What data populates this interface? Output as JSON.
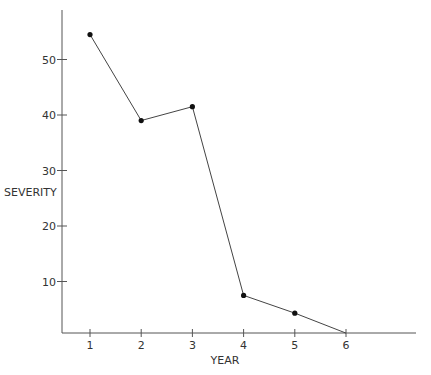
{
  "chart_data": {
    "type": "line",
    "title": "",
    "xlabel": "YEAR",
    "ylabel": "SEVERITY",
    "x": [
      1,
      2,
      3,
      4,
      5,
      6
    ],
    "categories": [
      "1",
      "2",
      "3",
      "4",
      "5",
      "6"
    ],
    "series": [
      {
        "name": "Severity",
        "values": [
          54.5,
          39,
          41.5,
          7.5,
          4.3,
          0.7
        ],
        "markers": [
          true,
          true,
          true,
          true,
          true,
          false
        ]
      }
    ],
    "xticks": [
      "1",
      "2",
      "3",
      "4",
      "5",
      "6"
    ],
    "yticks": [
      "10",
      "20",
      "30",
      "40",
      "50"
    ],
    "ylim": [
      0,
      59
    ],
    "xlim": [
      0.45,
      7.4
    ],
    "grid": false,
    "legend": null
  },
  "colors": {
    "axis": "#555555",
    "line": "#444444",
    "marker": "#111111",
    "text": "#333333"
  }
}
